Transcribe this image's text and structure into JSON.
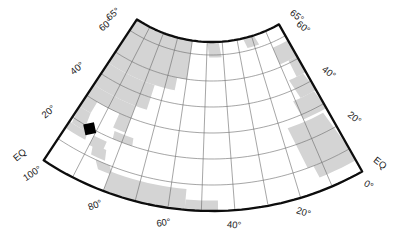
{
  "figure": {
    "kind": "conic-projection-map",
    "background": "#ffffff",
    "land_color": "#d4d4d4",
    "grid_color": "#6a6a6a",
    "border_color": "#0d0d0d",
    "label_color": "#1a1a1a",
    "marker_color": "#000000"
  },
  "map": {
    "projection": {
      "type": "equidistant-conic",
      "apex_x": 212,
      "apex_y": -94,
      "r_equator": 305,
      "px_per_deg_lat": 2.6,
      "cone_constant": 0.63,
      "tilt_deg": -2,
      "central_meridian_w": 50
    },
    "extent": {
      "lat_min": 0,
      "lat_max": 65,
      "lon_west_w": 100,
      "lon_east_w": 0
    },
    "graticule": {
      "parallels": [
        10,
        20,
        30,
        40,
        50,
        60
      ],
      "meridians_w": [
        90,
        80,
        70,
        60,
        50,
        40,
        30,
        20,
        10
      ]
    },
    "labels": {
      "left": [
        {
          "text": "65°",
          "lat": 65
        },
        {
          "text": "60°",
          "lat": 60
        },
        {
          "text": "40°",
          "lat": 40
        },
        {
          "text": "20°",
          "lat": 20
        },
        {
          "text": "EQ",
          "lat": 0
        }
      ],
      "right": [
        {
          "text": "65°",
          "lat": 65
        },
        {
          "text": "60°",
          "lat": 60
        },
        {
          "text": "40°",
          "lat": 40
        },
        {
          "text": "20°",
          "lat": 20
        },
        {
          "text": "EQ",
          "lat": 0
        }
      ],
      "bottom": [
        {
          "text": "100°",
          "lon_w": 100
        },
        {
          "text": "80°",
          "lon_w": 80
        },
        {
          "text": "60°",
          "lon_w": 60
        },
        {
          "text": "40°",
          "lon_w": 40
        },
        {
          "text": "20°",
          "lon_w": 20
        },
        {
          "text": "0°",
          "lon_w": 0
        }
      ]
    },
    "land_rects_w_e_s_n": [
      [
        100,
        60,
        50,
        65
      ],
      [
        50,
        41,
        59,
        65
      ],
      [
        26,
        17,
        61,
        65
      ],
      [
        100,
        65,
        45,
        50
      ],
      [
        100,
        75,
        40,
        45
      ],
      [
        100,
        75,
        35,
        40
      ],
      [
        100,
        80,
        30,
        35
      ],
      [
        100,
        95,
        25,
        30
      ],
      [
        85,
        80,
        24,
        30
      ],
      [
        100,
        94,
        18,
        25
      ],
      [
        100,
        92,
        15,
        18
      ],
      [
        90,
        85,
        14,
        18
      ],
      [
        84,
        76,
        20,
        23
      ],
      [
        89,
        83,
        11,
        15
      ],
      [
        86,
        79,
        7,
        10
      ],
      [
        80,
        55,
        0,
        8
      ],
      [
        55,
        45,
        0,
        4
      ],
      [
        10,
        0,
        51,
        58
      ],
      [
        5,
        0,
        44,
        51
      ],
      [
        9,
        0,
        36,
        44
      ],
      [
        11,
        0,
        28,
        36
      ],
      [
        17,
        0,
        10,
        27
      ],
      [
        13,
        0,
        5,
        10
      ]
    ],
    "marker": {
      "shape": "filled-square",
      "lat": 19.6,
      "lon_w": 92.5,
      "size_px": 11,
      "rotation_deg": -12
    }
  }
}
